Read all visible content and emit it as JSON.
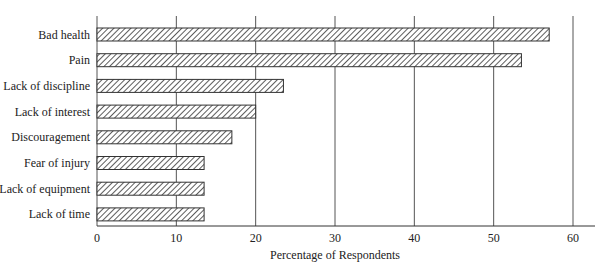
{
  "chart_data": {
    "type": "bar",
    "orientation": "horizontal",
    "title": "",
    "xlabel": "Percentage of Respondents",
    "ylabel": "",
    "categories": [
      "Bad health",
      "Pain",
      "Lack of discipline",
      "Lack of interest",
      "Discouragement",
      "Fear of injury",
      "Lack of equipment",
      "Lack of time"
    ],
    "values": [
      57,
      53.5,
      23.5,
      20,
      17,
      13.5,
      13.5,
      13.5
    ],
    "xlim": [
      0,
      60
    ],
    "xticks": [
      "0",
      "10",
      "20",
      "30",
      "40",
      "50",
      "60"
    ],
    "grid": "vertical gridlines at each x tick",
    "legend": "none",
    "bar_fill": "diagonal hatch",
    "colors": {
      "bar_stroke": "#333333",
      "hatch": "#333333",
      "grid": "#555555",
      "background": "#ffffff"
    }
  }
}
